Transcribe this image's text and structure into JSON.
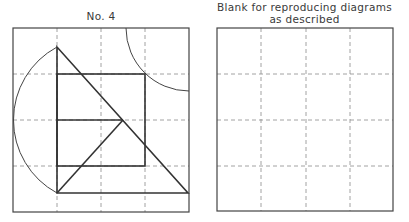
{
  "left_panel": {
    "title": "No. 4",
    "frame": {
      "x": 13,
      "y": 28,
      "w": 176,
      "h": 184
    },
    "grid_x": [
      57,
      101,
      145
    ],
    "grid_y": [
      74,
      120,
      166
    ]
  },
  "right_panel": {
    "title_line1": "Blank for reproducing diagrams",
    "title_line2": "as described",
    "frame": {
      "x": 217,
      "y": 28,
      "w": 176,
      "h": 183
    },
    "grid_x": [
      261,
      306,
      350
    ],
    "grid_y": [
      74,
      120,
      166
    ]
  },
  "colors": {
    "line": "#333333",
    "dash": "#8a8a8a"
  }
}
